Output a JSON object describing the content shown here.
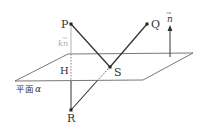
{
  "diagram": {
    "title": "",
    "points": [
      {
        "id": "P",
        "label": "P",
        "x": 71,
        "y": 24
      },
      {
        "id": "Q",
        "label": "Q",
        "x": 147,
        "y": 24
      },
      {
        "id": "S",
        "label": "S",
        "x": 110,
        "y": 67
      },
      {
        "id": "R",
        "label": "R",
        "x": 71,
        "y": 110
      },
      {
        "id": "H",
        "label": "H",
        "x": 71,
        "y": 69
      }
    ],
    "segments": [
      {
        "from": "P",
        "to": "S",
        "style": "solid"
      },
      {
        "from": "S",
        "to": "Q",
        "style": "solid"
      },
      {
        "from": "R",
        "to": "S",
        "style": "solid-below-dashed-under-plane"
      },
      {
        "from": "P",
        "to": "R",
        "style": "gray-dashed-through-plane"
      }
    ],
    "plane": {
      "label": "平面",
      "symbol": "α",
      "corners": [
        [
          68,
          54
        ],
        [
          193,
          53
        ],
        [
          143,
          80
        ],
        [
          15,
          81
        ]
      ]
    },
    "normal_vector": {
      "label": "n",
      "arrow": "→",
      "x": 170,
      "y_from": 57,
      "y_to": 26
    },
    "kn_label": {
      "k": "k",
      "n": "n",
      "arrow": "→"
    },
    "colors": {
      "line": "#333333",
      "gray": "#aaaaaa"
    }
  }
}
